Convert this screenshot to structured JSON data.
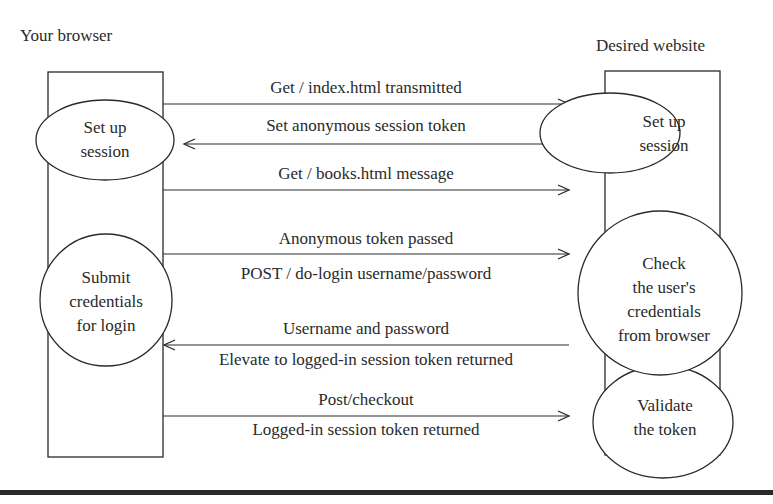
{
  "actors": {
    "left": {
      "title": "Your browser"
    },
    "right": {
      "title": "Desired website"
    }
  },
  "nodes": {
    "browser_setup": {
      "lines": [
        "Set up",
        "session"
      ]
    },
    "browser_submit": {
      "lines": [
        "Submit",
        "credentials",
        "for login"
      ]
    },
    "website_setup": {
      "lines": [
        "Set up",
        "session"
      ]
    },
    "website_check": {
      "lines": [
        "Check",
        "the user's",
        "credentials",
        "from browser"
      ]
    },
    "website_validate": {
      "lines": [
        "Validate",
        "the token"
      ]
    }
  },
  "messages": [
    {
      "label": "Get / index.html transmitted",
      "direction": "right"
    },
    {
      "label": "Set anonymous session token",
      "direction": "left"
    },
    {
      "label": "Get / books.html message",
      "direction": "right"
    },
    {
      "label": "Anonymous token passed",
      "direction": "right"
    },
    {
      "label": "POST / do-login username/password",
      "direction": "right"
    },
    {
      "label": "Username and password",
      "direction": "left"
    },
    {
      "label": "Elevate to logged-in session token returned",
      "direction": "left"
    },
    {
      "label": "Post/checkout",
      "direction": "right"
    },
    {
      "label": "Logged-in session token returned",
      "direction": "right"
    }
  ],
  "colors": {
    "stroke": "#2a2a2a",
    "background": "#ffffff"
  }
}
